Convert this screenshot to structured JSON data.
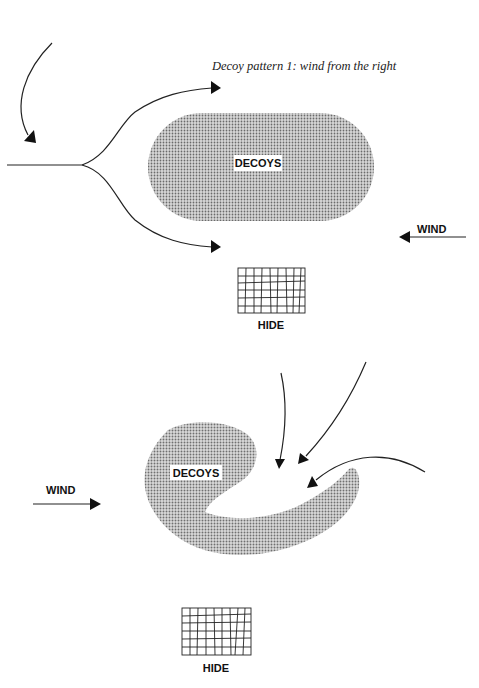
{
  "figure": {
    "caption": "Decoy pattern 1: wind from the right",
    "colors": {
      "decoy_fill": "#b8b8b8",
      "ink": "#111111",
      "background": "#ffffff"
    },
    "pattern1": {
      "decoys_label": "DECOYS",
      "wind_label": "WIND",
      "wind_direction": "from the right",
      "hide_label": "HIDE",
      "decoy_shape": "oval",
      "approach_arrows": 3
    },
    "pattern2": {
      "decoys_label": "DECOYS",
      "wind_label": "WIND",
      "wind_direction": "from the left",
      "hide_label": "HIDE",
      "decoy_shape": "hook",
      "approach_arrows": 3
    }
  }
}
